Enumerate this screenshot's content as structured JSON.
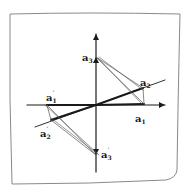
{
  "diagram": {
    "type": "hand-drawn vector diagram",
    "colors": {
      "paper": "#ffffff",
      "ink": "#1a1a1a",
      "thin_ink": "#555555",
      "border": "#8a8a8a"
    },
    "origin": [
      96,
      105
    ],
    "axes": {
      "horizontal": {
        "from": [
          27,
          105
        ],
        "to": [
          165,
          105
        ]
      },
      "vertical": {
        "from": [
          96,
          172
        ],
        "to": [
          96,
          34
        ]
      },
      "oblique": {
        "from": [
          35,
          127
        ],
        "to": [
          165,
          80
        ]
      }
    },
    "points": [
      {
        "id": "a1",
        "label": "a",
        "sub": "1",
        "prime": false,
        "pos": [
          144,
          104
        ],
        "label_pos": [
          135,
          122
        ]
      },
      {
        "id": "a2",
        "label": "a",
        "sub": "2",
        "prime": false,
        "pos": [
          143,
          88
        ],
        "label_pos": [
          140,
          86
        ]
      },
      {
        "id": "a3",
        "label": "a",
        "sub": "3",
        "prime": false,
        "pos": [
          96,
          57
        ],
        "label_pos": [
          82,
          61
        ]
      },
      {
        "id": "a1p",
        "label": "a",
        "sub": "1",
        "prime": true,
        "pos": [
          47,
          105
        ],
        "label_pos": [
          46,
          101
        ]
      },
      {
        "id": "a2p",
        "label": "a",
        "sub": "2",
        "prime": true,
        "pos": [
          51,
          120
        ],
        "label_pos": [
          40,
          137
        ]
      },
      {
        "id": "a3p",
        "label": "a",
        "sub": "3",
        "prime": true,
        "pos": [
          96,
          155
        ],
        "label_pos": [
          101,
          158
        ]
      }
    ]
  }
}
